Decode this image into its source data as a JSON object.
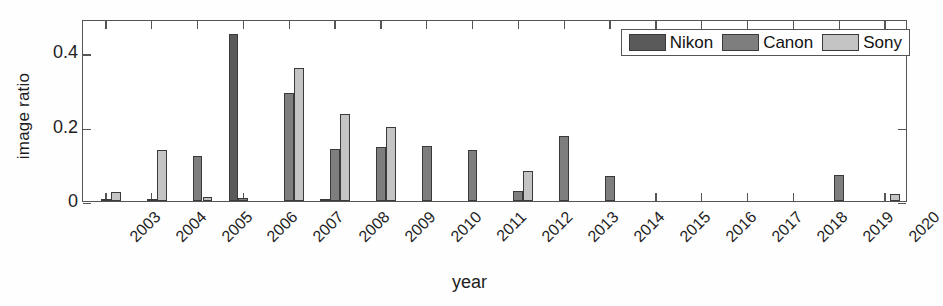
{
  "chart_data": {
    "type": "bar",
    "title": "",
    "xlabel": "year",
    "ylabel": "image ratio",
    "grid": false,
    "legend_position": "top-right",
    "categories": [
      "2003",
      "2004",
      "2005",
      "2006",
      "2007",
      "2008",
      "2009",
      "2010",
      "2011",
      "2012",
      "2013",
      "2014",
      "2015",
      "2016",
      "2017",
      "2018",
      "2019",
      "2020"
    ],
    "ylim": [
      0,
      0.49
    ],
    "yticks": [
      0,
      0.2,
      0.4
    ],
    "ytick_labels": [
      "0",
      "0.2",
      "0.4"
    ],
    "series": [
      {
        "name": "Nikon",
        "color": "#5a5a5a",
        "values": [
          0,
          0,
          0,
          0.45,
          0,
          0.005,
          0,
          0,
          0,
          0,
          0,
          0,
          0,
          0,
          0,
          0,
          0,
          0
        ]
      },
      {
        "name": "Canon",
        "color": "#7e7e7e",
        "values": [
          0.003,
          0.003,
          0.12,
          0.007,
          0.29,
          0.14,
          0.145,
          0.147,
          0.137,
          0.028,
          0.175,
          0.068,
          0,
          0,
          0,
          0,
          0.071,
          0
        ]
      },
      {
        "name": "Sony",
        "color": "#c4c4c4",
        "values": [
          0.024,
          0.137,
          0.01,
          0,
          0.358,
          0.235,
          0.198,
          0,
          0,
          0.082,
          0,
          0,
          0,
          0,
          0,
          0,
          0,
          0.019
        ]
      }
    ]
  },
  "legend": {
    "entries": [
      {
        "label": "Nikon"
      },
      {
        "label": "Canon"
      },
      {
        "label": "Sony"
      }
    ]
  },
  "axes": {
    "y_title": "image ratio",
    "x_title": "year"
  }
}
